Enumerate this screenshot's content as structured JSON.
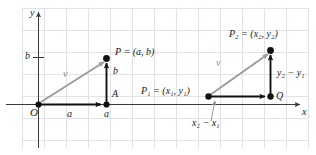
{
  "figure": {
    "type": "vector-diagram",
    "background_color": "#ffffff",
    "grid_color": "#d9dde2",
    "axis_color": "#3a3a3a",
    "vector_color": "#9a9a9a",
    "segment_color": "#1a1a1a",
    "point_color": "#111111",
    "axes": {
      "y_label": "y",
      "x_label": "x",
      "origin_label": "O",
      "y_tick_label": "b"
    },
    "left_diagram": {
      "point_P_label": "P = (a, b)",
      "point_A_label": "A",
      "vector_label": "v",
      "horizontal_component_label": "a",
      "x_axis_foot_label": "a",
      "vertical_component_label": "b"
    },
    "right_diagram": {
      "point_P2_label": "P₂ = (x₂, y₂)",
      "point_P1_label": "P₁ = (x₁, y₁)",
      "point_Q_label": "Q",
      "vector_label": "v",
      "horizontal_component_label": "x₂ − x₁",
      "vertical_component_label": "y₂ − y₁"
    }
  }
}
